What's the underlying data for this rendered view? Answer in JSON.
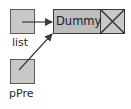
{
  "diagram": {
    "title": "",
    "colors": {
      "box_fill": "#c8c8c8",
      "box_stroke": "#5a5a5a",
      "node_fill": "#bdbdbd",
      "node_stroke": "#3a3a3a",
      "arrow": "#3a3a3a",
      "text": "#1a1a1a"
    },
    "nodes": [
      {
        "id": "list",
        "type": "pointer",
        "label": "list"
      },
      {
        "id": "pPre",
        "type": "pointer",
        "label": "pPre"
      },
      {
        "id": "dummy",
        "type": "list-node",
        "data": "Dummy",
        "next": "null"
      }
    ],
    "edges": [
      {
        "from": "list",
        "to": "dummy"
      },
      {
        "from": "pPre",
        "to": "dummy"
      }
    ]
  }
}
